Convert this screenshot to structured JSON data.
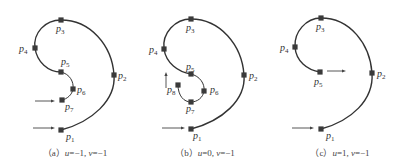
{
  "figure": {
    "panels": [
      {
        "id": "a",
        "caption": {
          "prefix": "（a）",
          "u_label": "u",
          "u_value": "=−1, ",
          "v_label": "v",
          "v_value": "=−1"
        },
        "caption_x": 75,
        "curves": [
          {
            "d": "M61,130 C92,122 116,100 114,75 C112,45 90,20 61,20 C45,20 33,33 35,48 C37,62 48,72 61,72",
            "cls": "curve"
          },
          {
            "d": "M61,72 C70,74 74,82 73,89 C72,95 67,99 62,100",
            "cls": "curve-thin"
          }
        ],
        "points": [
          {
            "name": "p",
            "sub": "1",
            "x": 61,
            "y": 130,
            "lx": 66,
            "ly": 140
          },
          {
            "name": "p",
            "sub": "2",
            "x": 114,
            "y": 75,
            "lx": 118,
            "ly": 79
          },
          {
            "name": "p",
            "sub": "3",
            "x": 61,
            "y": 20,
            "lx": 56,
            "ly": 32
          },
          {
            "name": "p",
            "sub": "4",
            "x": 35,
            "y": 48,
            "lx": 19,
            "ly": 52
          },
          {
            "name": "p",
            "sub": "5",
            "x": 61,
            "y": 72,
            "lx": 61,
            "ly": 65
          },
          {
            "name": "p",
            "sub": "6",
            "x": 73,
            "y": 89,
            "lx": 77,
            "ly": 93
          },
          {
            "name": "p",
            "sub": "7",
            "x": 62,
            "y": 100,
            "lx": 65,
            "ly": 110
          }
        ],
        "arrows": [
          {
            "x1": 35,
            "y1": 101,
            "x2": 55,
            "y2": 101
          },
          {
            "x1": 33,
            "y1": 128,
            "x2": 55,
            "y2": 128
          }
        ]
      },
      {
        "id": "b",
        "caption": {
          "prefix": "（b）",
          "u_label": "u",
          "u_value": "=0, ",
          "v_label": "v",
          "v_value": "=−1"
        },
        "caption_x": 205,
        "curves": [
          {
            "d": "M191,129 C222,121 246,100 244,75 C242,45 220,19 191,19 C175,19 162,33 164,49 C166,63 178,72 191,74",
            "cls": "curve"
          },
          {
            "d": "M191,74 C200,76 205,84 204,91 C203,98 197,102 191,102 C184,102 178,96 178,85",
            "cls": "curve-thin"
          }
        ],
        "points": [
          {
            "name": "p",
            "sub": "1",
            "x": 191,
            "y": 129,
            "lx": 193,
            "ly": 139
          },
          {
            "name": "p",
            "sub": "2",
            "x": 244,
            "y": 75,
            "lx": 249,
            "ly": 79
          },
          {
            "name": "p",
            "sub": "3",
            "x": 191,
            "y": 19,
            "lx": 186,
            "ly": 31
          },
          {
            "name": "p",
            "sub": "4",
            "x": 164,
            "y": 49,
            "lx": 149,
            "ly": 53
          },
          {
            "name": "p",
            "sub": "5",
            "x": 191,
            "y": 74,
            "lx": 186,
            "ly": 70
          },
          {
            "name": "p",
            "sub": "6",
            "x": 204,
            "y": 91,
            "lx": 210,
            "ly": 93
          },
          {
            "name": "p",
            "sub": "7",
            "x": 191,
            "y": 102,
            "lx": 186,
            "ly": 112
          },
          {
            "name": "p",
            "sub": "8",
            "x": 178,
            "y": 85,
            "lx": 167,
            "ly": 93
          }
        ],
        "arrows": [
          {
            "x1": 166,
            "y1": 88,
            "x2": 166,
            "y2": 72
          },
          {
            "x1": 162,
            "y1": 128,
            "x2": 185,
            "y2": 128
          }
        ]
      },
      {
        "id": "c",
        "caption": {
          "prefix": "（c）",
          "u_label": "u",
          "u_value": "=1, ",
          "v_label": "v",
          "v_value": "=−1"
        },
        "caption_x": 340,
        "curves": [
          {
            "d": "M321,129 C351,121 374,100 372,73 C370,44 350,18 321,18 C306,18 294,32 295,47 C296,61 307,70 320,72",
            "cls": "curve"
          }
        ],
        "points": [
          {
            "name": "p",
            "sub": "1",
            "x": 321,
            "y": 129,
            "lx": 326,
            "ly": 139
          },
          {
            "name": "p",
            "sub": "2",
            "x": 372,
            "y": 73,
            "lx": 377,
            "ly": 77
          },
          {
            "name": "p",
            "sub": "3",
            "x": 321,
            "y": 18,
            "lx": 316,
            "ly": 30
          },
          {
            "name": "p",
            "sub": "4",
            "x": 295,
            "y": 47,
            "lx": 280,
            "ly": 51
          },
          {
            "name": "p",
            "sub": "5",
            "x": 320,
            "y": 72,
            "lx": 314,
            "ly": 85
          }
        ],
        "arrows": [
          {
            "x1": 327,
            "y1": 71,
            "x2": 346,
            "y2": 71
          },
          {
            "x1": 292,
            "y1": 128,
            "x2": 314,
            "y2": 128
          }
        ]
      }
    ],
    "colors": {
      "curve": "#333333",
      "marker": "#3a3a3a",
      "background": "#ffffff"
    }
  }
}
